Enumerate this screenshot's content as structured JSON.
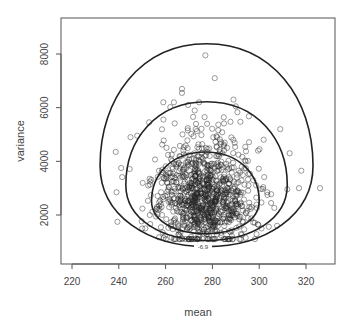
{
  "chart_data": {
    "type": "scatter",
    "title": "",
    "xlabel": "mean",
    "ylabel": "variance",
    "xlim": [
      215,
      335
    ],
    "ylim": [
      -600,
      9200
    ],
    "x_ticks": [
      220,
      240,
      260,
      280,
      300,
      320
    ],
    "x_tick_labels": [
      "220",
      "240",
      "260",
      "280",
      "300",
      "320"
    ],
    "y_ticks": [
      2000,
      4000,
      6000,
      8000
    ],
    "y_tick_labels": [
      "2000",
      "4000",
      "6000",
      "8000"
    ],
    "grid": false,
    "legend": null,
    "marker": "open-circle",
    "point_color": "#222222",
    "n_points_approx": 1000,
    "cluster": {
      "center_mean": 276,
      "center_variance": 2500,
      "sd_mean": 11,
      "sd_variance": 750
    },
    "notable_points": [
      {
        "x": 277,
        "y": 7950
      },
      {
        "x": 281,
        "y": 7100
      },
      {
        "x": 267,
        "y": 6700
      },
      {
        "x": 267,
        "y": 6550
      },
      {
        "x": 289,
        "y": 6300
      },
      {
        "x": 290,
        "y": 6050
      },
      {
        "x": 326,
        "y": 3000
      },
      {
        "x": 318,
        "y": 3650
      },
      {
        "x": 317,
        "y": 3000
      },
      {
        "x": 313,
        "y": 4300
      },
      {
        "x": 309,
        "y": 5200
      },
      {
        "x": 239,
        "y": 2850
      },
      {
        "x": 241,
        "y": 3750
      },
      {
        "x": 245,
        "y": 4900
      },
      {
        "x": 250,
        "y": 1500
      },
      {
        "x": 301,
        "y": 1500
      }
    ],
    "contours": [
      {
        "label": "-6.9",
        "level": "outer",
        "mean_range": [
          232,
          323
        ],
        "variance_range": [
          820,
          8380
        ],
        "label_at": {
          "x": 276,
          "y": 800
        }
      },
      {
        "level": "middle",
        "mean_range": [
          243,
          312
        ],
        "variance_range": [
          1050,
          6220
        ]
      },
      {
        "level": "inner",
        "mean_range": [
          254,
          300
        ],
        "variance_range": [
          1300,
          4350
        ]
      }
    ]
  }
}
